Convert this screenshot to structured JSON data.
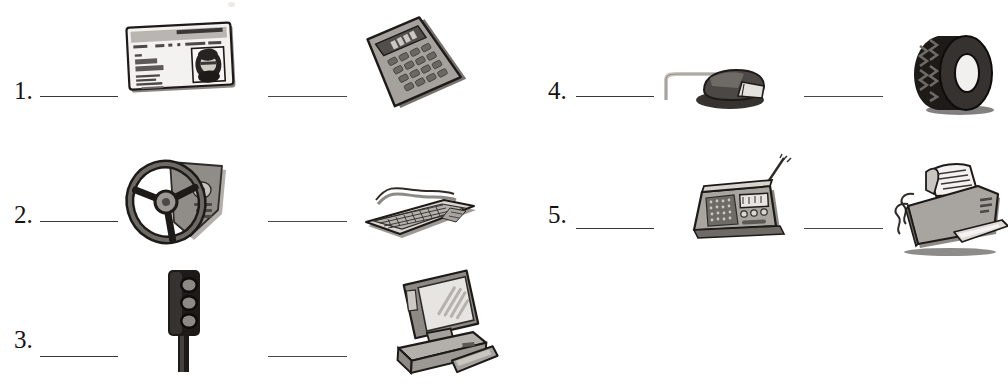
{
  "worksheet": {
    "title": "Vocabulary matching worksheet",
    "columns": [
      {
        "side": "left",
        "items": [
          {
            "number": "1.",
            "blanks": [
              "",
              ""
            ],
            "pictures": [
              {
                "name": "id-card",
                "label": "driver's license ID card"
              },
              {
                "name": "calculator",
                "label": "calculator"
              }
            ]
          },
          {
            "number": "2.",
            "blanks": [
              "",
              ""
            ],
            "pictures": [
              {
                "name": "steering-wheel",
                "label": "steering wheel and dashboard"
              },
              {
                "name": "keyboard",
                "label": "computer keyboard"
              }
            ]
          },
          {
            "number": "3.",
            "blanks": [
              "",
              ""
            ],
            "pictures": [
              {
                "name": "traffic-light",
                "label": "traffic light"
              },
              {
                "name": "desktop-computer",
                "label": "desktop computer with monitor"
              }
            ]
          }
        ]
      },
      {
        "side": "right",
        "items": [
          {
            "number": "4.",
            "blanks": [
              "",
              ""
            ],
            "pictures": [
              {
                "name": "computer-mouse",
                "label": "computer mouse with cable"
              },
              {
                "name": "tire",
                "label": "car tire"
              }
            ]
          },
          {
            "number": "5.",
            "blanks": [
              "",
              ""
            ],
            "pictures": [
              {
                "name": "radio",
                "label": "radio with antenna"
              },
              {
                "name": "fax-machine",
                "label": "fax machine printing paper"
              }
            ]
          }
        ]
      }
    ],
    "colors": {
      "paper": "#ffffff",
      "ink": "#15110f",
      "line": "#3a3734",
      "art_dark": "#2e2b28",
      "art_mid": "#8d8a86",
      "art_light": "#c9c6c2"
    }
  }
}
